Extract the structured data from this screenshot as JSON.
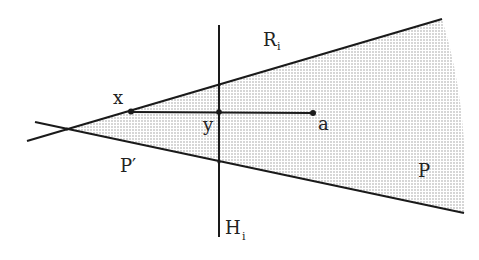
{
  "diagram": {
    "colors": {
      "line": "#1a1a1a",
      "shade": "#b8b8b8",
      "background": "#ffffff"
    },
    "labels": {
      "R": {
        "text": "R",
        "sub": "i"
      },
      "H": {
        "text": "H",
        "sub": "i"
      },
      "x": {
        "text": "x"
      },
      "y": {
        "text": "y"
      },
      "a": {
        "text": "a"
      },
      "P_prime": {
        "text": "P′"
      },
      "P": {
        "text": "P"
      }
    }
  }
}
